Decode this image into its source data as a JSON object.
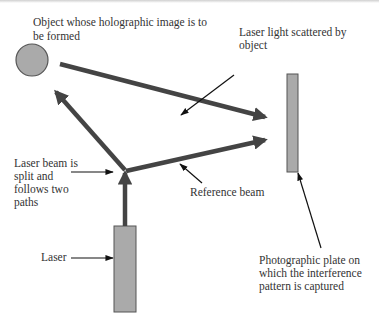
{
  "diagram": {
    "colors": {
      "beam": "#444444",
      "component_fill": "#aaaaaa",
      "component_stroke": "#555555",
      "pointer": "#111111",
      "text": "#333333"
    },
    "labels": {
      "object_line1": "Object whose holographic image is to",
      "object_line2": "be formed",
      "scattered_line1": "Laser light scattered by",
      "scattered_line2": "object",
      "split_line1": "Laser beam is",
      "split_line2": "split and",
      "split_line3": "follows two",
      "split_line4": "paths",
      "reference": "Reference beam",
      "laser": "Laser",
      "plate_line1": "Photographic plate on",
      "plate_line2": "which the interference",
      "plate_line3": "pattern is captured"
    },
    "components": [
      {
        "name": "object",
        "shape": "circle"
      },
      {
        "name": "laser",
        "shape": "rectangle"
      },
      {
        "name": "photographic-plate",
        "shape": "rectangle"
      },
      {
        "name": "beam-splitter-point",
        "shape": "point"
      }
    ],
    "beams": [
      {
        "from": "laser",
        "to": "beam-splitter-point"
      },
      {
        "from": "beam-splitter-point",
        "to": "object"
      },
      {
        "from": "object",
        "to": "photographic-plate",
        "label": "Laser light scattered by object"
      },
      {
        "from": "beam-splitter-point",
        "to": "photographic-plate",
        "label": "Reference beam"
      }
    ]
  }
}
